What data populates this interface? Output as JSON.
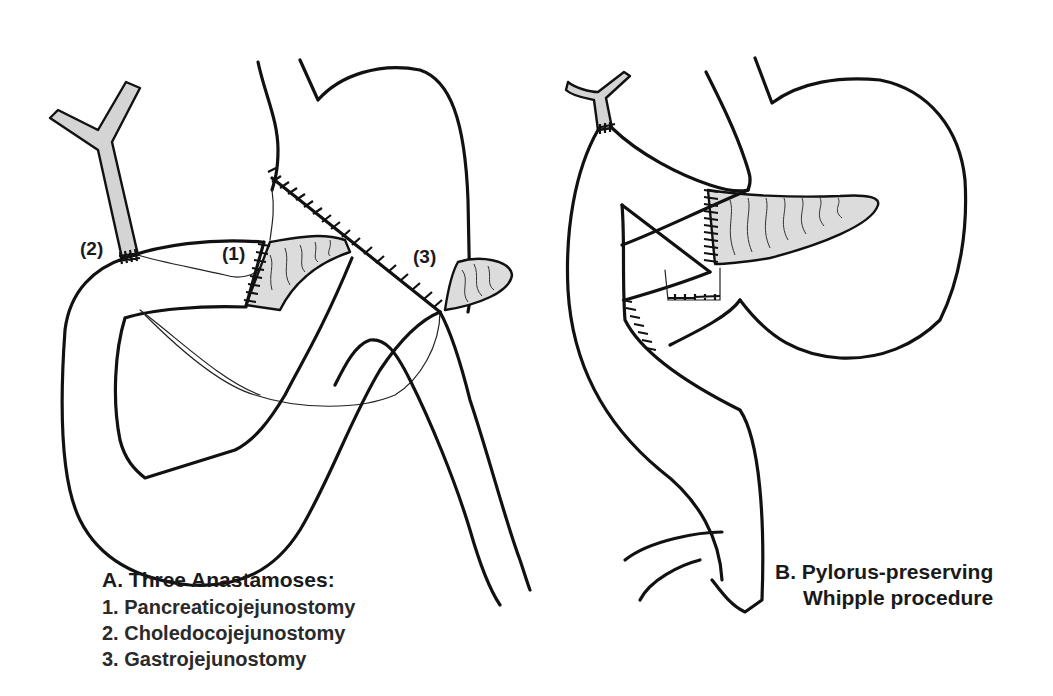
{
  "figure": {
    "panel_a": {
      "title": "A.  Three Anastamoses:",
      "items": [
        "1.  Pancreaticojejunostomy",
        "2.  Choledocojejunostomy",
        "3.  Gastrojejunostomy"
      ],
      "markers": {
        "one": "(1)",
        "two": "(2)",
        "three": "(3)"
      }
    },
    "panel_b": {
      "title_line1": "B.  Pylorus-preserving",
      "title_line2": "Whipple procedure"
    },
    "colors": {
      "ink": "#111111",
      "duct_fill": "#d4d4d4",
      "pancreas_fill": "#dcdcdc",
      "background": "#ffffff"
    }
  }
}
